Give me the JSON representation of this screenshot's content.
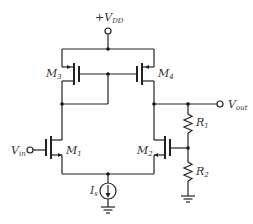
{
  "diagram": {
    "type": "circuit-schematic",
    "labels": {
      "vdd": {
        "main": "+V",
        "sub": "DD"
      },
      "vin": {
        "main": "V",
        "sub": "in"
      },
      "vout": {
        "main": "V",
        "sub": "out"
      },
      "m1": {
        "main": "M",
        "sub": "1"
      },
      "m2": {
        "main": "M",
        "sub": "2"
      },
      "m3": {
        "main": "M",
        "sub": "3"
      },
      "m4": {
        "main": "M",
        "sub": "4"
      },
      "r1": {
        "main": "R",
        "sub": "1"
      },
      "r2": {
        "main": "R",
        "sub": "2"
      },
      "is": {
        "main": "I",
        "sub": "s"
      }
    },
    "components": [
      {
        "id": "M1",
        "kind": "NMOS",
        "role": "input transistor"
      },
      {
        "id": "M2",
        "kind": "NMOS",
        "role": "feedback input transistor"
      },
      {
        "id": "M3",
        "kind": "PMOS",
        "role": "diode-connected mirror load"
      },
      {
        "id": "M4",
        "kind": "PMOS",
        "role": "mirror load"
      },
      {
        "id": "R1",
        "kind": "resistor",
        "role": "feedback divider top"
      },
      {
        "id": "R2",
        "kind": "resistor",
        "role": "feedback divider bottom"
      },
      {
        "id": "Is",
        "kind": "current source",
        "role": "tail current"
      }
    ],
    "colors": {
      "line": "#222222",
      "text": "#333333",
      "background": "#ffffff"
    }
  }
}
